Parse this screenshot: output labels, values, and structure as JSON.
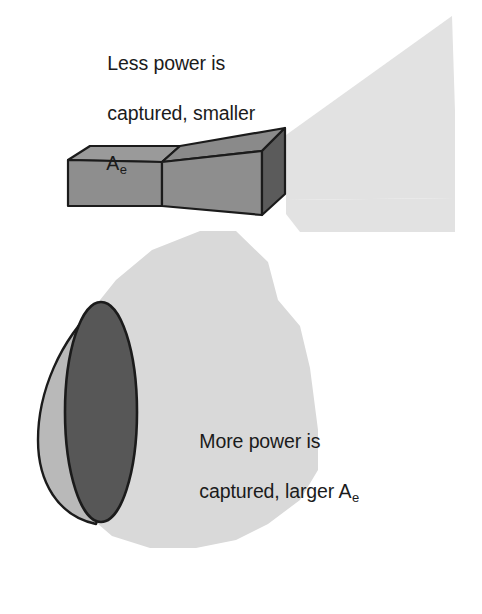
{
  "figure": {
    "type": "technical-illustration",
    "background_color": "#ffffff",
    "annotations": [
      {
        "id": "horn",
        "line1": "Less power is",
        "line2": "captured, smaller",
        "line3_symbol": "A",
        "line3_subscript": "e",
        "full_text": "Less power is captured, smaller Ae"
      },
      {
        "id": "dish",
        "line1": "More power is",
        "line2_prefix": "captured, larger ",
        "line2_symbol": "A",
        "line2_subscript": "e",
        "full_text": "More power is captured, larger Ae"
      }
    ]
  },
  "colors": {
    "beam_fill": "#e2e2e2",
    "horn_side_light": "#8e8e8e",
    "horn_top_mid": "#8a8a8a",
    "horn_face_dark": "#5b5b5b",
    "dish_back_light": "#b9b9b9",
    "dish_face_dark": "#575757",
    "outline": "#1b1b1b",
    "text": "#1b1b1b",
    "background": "#ffffff"
  },
  "objects": {
    "horn_antenna": {
      "name": "pyramidal horn antenna",
      "parts": [
        "waveguide-box",
        "flared-horn",
        "aperture-face"
      ],
      "beam": "narrow radiation cone, small effective aperture"
    },
    "dish_antenna": {
      "name": "parabolic dish antenna",
      "parts": [
        "dish-back-reflector",
        "dish-aperture-face"
      ],
      "beam": "wide radiation region, large effective aperture"
    }
  }
}
